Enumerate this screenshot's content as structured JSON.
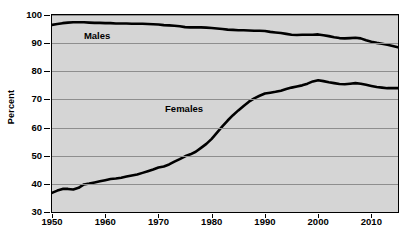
{
  "chart_data": {
    "type": "line",
    "title": "",
    "xlabel": "",
    "ylabel": "Percent",
    "xlim": [
      1950,
      2015
    ],
    "ylim": [
      30,
      100
    ],
    "grid": true,
    "legend_position": "inline-labels",
    "ytick_labels": [
      "100",
      "90",
      "80",
      "70",
      "60",
      "50",
      "40",
      "30"
    ],
    "ytick_values": [
      100,
      90,
      80,
      70,
      60,
      50,
      40,
      30
    ],
    "xtick_labels": [
      "1950",
      "1960",
      "1970",
      "1980",
      "1990",
      "2000",
      "2010"
    ],
    "xtick_values": [
      1950,
      1960,
      1970,
      1980,
      1990,
      2000,
      2010
    ],
    "x": [
      1950,
      1951,
      1952,
      1953,
      1954,
      1955,
      1956,
      1957,
      1958,
      1959,
      1960,
      1961,
      1962,
      1963,
      1964,
      1965,
      1966,
      1967,
      1968,
      1969,
      1970,
      1971,
      1972,
      1973,
      1974,
      1975,
      1976,
      1977,
      1978,
      1979,
      1980,
      1981,
      1982,
      1983,
      1984,
      1985,
      1986,
      1987,
      1988,
      1989,
      1990,
      1991,
      1992,
      1993,
      1994,
      1995,
      1996,
      1997,
      1998,
      1999,
      2000,
      2001,
      2002,
      2003,
      2004,
      2005,
      2006,
      2007,
      2008,
      2009,
      2010,
      2011,
      2012,
      2013,
      2014,
      2015
    ],
    "series": [
      {
        "name": "Males",
        "color": "#000000",
        "label_x": 1959,
        "label_y": 92.5,
        "values": [
          96.5,
          96.8,
          97.1,
          97.3,
          97.4,
          97.4,
          97.4,
          97.3,
          97.2,
          97.2,
          97.1,
          97.1,
          97.0,
          97.0,
          97.0,
          96.9,
          96.9,
          96.9,
          96.8,
          96.7,
          96.6,
          96.4,
          96.3,
          96.2,
          96.0,
          95.7,
          95.6,
          95.6,
          95.6,
          95.5,
          95.4,
          95.2,
          95.0,
          94.8,
          94.7,
          94.6,
          94.6,
          94.5,
          94.4,
          94.4,
          94.3,
          94.0,
          93.8,
          93.6,
          93.3,
          93.0,
          92.9,
          93.0,
          93.0,
          93.0,
          93.1,
          92.8,
          92.5,
          92.1,
          91.8,
          91.7,
          91.8,
          91.9,
          91.7,
          91.0,
          90.5,
          90.1,
          89.8,
          89.4,
          89.0,
          88.5
        ]
      },
      {
        "name": "Females",
        "color": "#000000",
        "label_x": 1975,
        "label_y": 66.5,
        "values": [
          36.8,
          37.6,
          38.2,
          38.2,
          38.0,
          38.6,
          39.8,
          40.1,
          40.5,
          40.9,
          41.3,
          41.7,
          41.9,
          42.2,
          42.6,
          43.0,
          43.3,
          43.9,
          44.5,
          45.1,
          45.8,
          46.2,
          46.9,
          47.9,
          48.8,
          49.8,
          50.5,
          51.4,
          52.8,
          54.2,
          56.0,
          58.2,
          60.4,
          62.5,
          64.4,
          66.1,
          67.7,
          69.2,
          70.4,
          71.3,
          72.1,
          72.4,
          72.7,
          73.1,
          73.7,
          74.2,
          74.6,
          75.0,
          75.6,
          76.4,
          76.8,
          76.5,
          76.1,
          75.8,
          75.5,
          75.4,
          75.6,
          75.8,
          75.6,
          75.2,
          74.8,
          74.4,
          74.2,
          74.0,
          74.0,
          74.0
        ]
      }
    ]
  }
}
